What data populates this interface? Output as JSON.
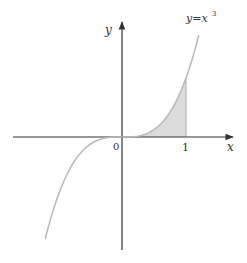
{
  "diagram": {
    "curve_label": "y=x",
    "curve_exponent": "3",
    "x_axis_label": "x",
    "y_axis_label": "y",
    "origin_label": "0",
    "tick_label_1": "1",
    "function": "y = x^3",
    "shaded_region": {
      "from": 0,
      "to": 1
    },
    "colors": {
      "axis": "#333333",
      "curve": "#b5b5b5",
      "shade": "#d9d9d9",
      "text": "#333333"
    }
  }
}
